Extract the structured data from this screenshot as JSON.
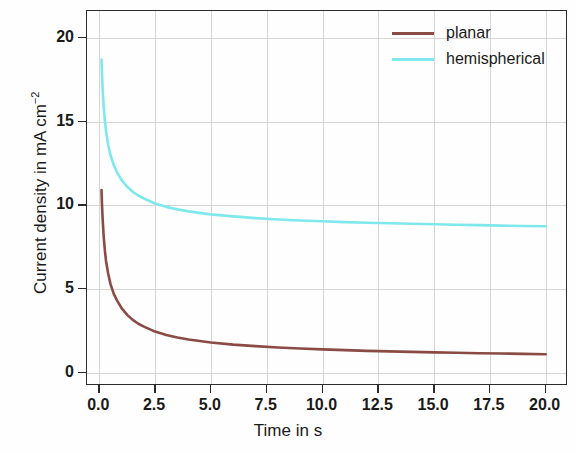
{
  "chart_data": {
    "type": "line",
    "title": "",
    "xlabel": "Time in s",
    "ylabel": "Current density in mA cm",
    "ylabel_exponent": "−2",
    "xlim": [
      -0.55,
      21.0
    ],
    "ylim": [
      -0.8,
      21.6
    ],
    "xticks": [
      0.0,
      2.5,
      5.0,
      7.5,
      10.0,
      12.5,
      15.0,
      17.5,
      20.0
    ],
    "xticklabels": [
      "0.0",
      "2.5",
      "5.0",
      "7.5",
      "10.0",
      "12.5",
      "15.0",
      "17.5",
      "20.0"
    ],
    "yticks": [
      0,
      5,
      10,
      15,
      20
    ],
    "yticklabels": [
      "0",
      "5",
      "10",
      "15",
      "20"
    ],
    "grid": true,
    "legend_position": "upper right",
    "series": [
      {
        "name": "planar",
        "color": "#8a4b44",
        "x": [
          0.1,
          0.12,
          0.15,
          0.2,
          0.25,
          0.3,
          0.4,
          0.5,
          0.65,
          0.8,
          1.0,
          1.25,
          1.5,
          1.75,
          2.0,
          2.5,
          3.0,
          3.5,
          4.0,
          5.0,
          6.0,
          7.0,
          8.0,
          9.0,
          10.0,
          11.0,
          12.0,
          13.0,
          14.0,
          15.0,
          16.0,
          17.0,
          18.0,
          19.0,
          20.0
        ],
        "y": [
          10.9,
          10.1,
          9.2,
          8.1,
          7.3,
          6.7,
          5.9,
          5.3,
          4.7,
          4.3,
          3.85,
          3.45,
          3.15,
          2.92,
          2.75,
          2.45,
          2.25,
          2.1,
          1.98,
          1.8,
          1.67,
          1.58,
          1.5,
          1.44,
          1.39,
          1.34,
          1.3,
          1.27,
          1.24,
          1.21,
          1.19,
          1.16,
          1.14,
          1.12,
          1.1
        ]
      },
      {
        "name": "hemispherical",
        "color": "#7fe8ec",
        "x": [
          0.1,
          0.12,
          0.15,
          0.2,
          0.25,
          0.3,
          0.4,
          0.5,
          0.65,
          0.8,
          1.0,
          1.25,
          1.5,
          1.75,
          2.0,
          2.5,
          3.0,
          3.5,
          4.0,
          5.0,
          6.0,
          7.0,
          8.0,
          9.0,
          10.0,
          11.0,
          12.0,
          13.0,
          14.0,
          15.0,
          16.0,
          17.0,
          18.0,
          19.0,
          20.0
        ],
        "y": [
          18.7,
          17.9,
          16.95,
          15.85,
          15.05,
          14.45,
          13.6,
          13.0,
          12.4,
          11.95,
          11.5,
          11.1,
          10.8,
          10.58,
          10.4,
          10.1,
          9.9,
          9.75,
          9.63,
          9.45,
          9.33,
          9.23,
          9.15,
          9.09,
          9.04,
          8.99,
          8.95,
          8.92,
          8.89,
          8.86,
          8.83,
          8.81,
          8.78,
          8.76,
          8.74
        ]
      }
    ],
    "legend": [
      {
        "label": "planar",
        "color": "#8a4b44"
      },
      {
        "label": "hemispherical",
        "color": "#7fe8ec"
      }
    ]
  },
  "colors": {
    "planar": "#8a4b44",
    "hemispherical": "#7fe8ec",
    "axis": "#2b2b2b",
    "grid": "#d6d6d6",
    "background": "#fefefe"
  }
}
